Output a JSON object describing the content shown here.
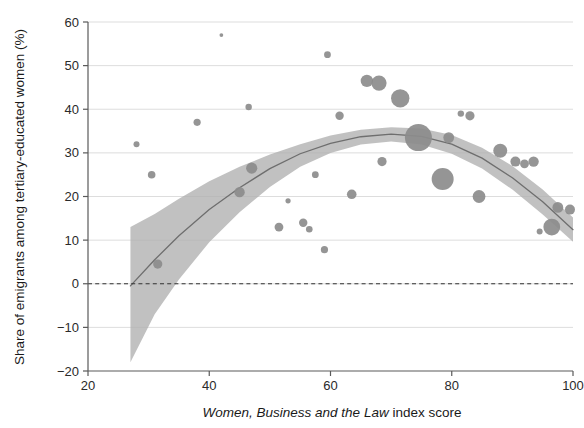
{
  "chart_data": {
    "type": "scatter",
    "title": "",
    "subtitle": "",
    "xlabel_italic": "Women, Business and the Law",
    "xlabel_rest": " index score",
    "xlabel": "Women, Business and the Law index score",
    "ylabel": "Share of emigrants among tertiary-educated women (%)",
    "xlim": [
      20,
      100
    ],
    "ylim": [
      -20,
      60
    ],
    "xticks": [
      20,
      40,
      60,
      80,
      100
    ],
    "yticks": [
      -20,
      -10,
      0,
      10,
      20,
      30,
      40,
      50,
      60
    ],
    "xtick_labels": [
      "20",
      "40",
      "60",
      "80",
      "100"
    ],
    "ytick_labels": [
      "-20",
      "-10",
      "0",
      "10",
      "20",
      "30",
      "40",
      "50",
      "60"
    ],
    "grid": "horizontal",
    "legend": "none",
    "zero_reference_line": {
      "y": 0,
      "style": "dashed"
    },
    "marker_size_encodes": "population weight (bubble area)",
    "colors": {
      "bubble": "#8c8c8c",
      "band": "#b0b0b0",
      "trend_line": "#6e6e6e",
      "grid": "#d9d9d9",
      "axis": "#5a5a5a",
      "zero_line": "#333333",
      "background": "#ffffff"
    },
    "points": [
      {
        "x": 28.0,
        "y": 32.0,
        "r": 3.0
      },
      {
        "x": 30.5,
        "y": 25.0,
        "r": 3.8
      },
      {
        "x": 31.5,
        "y": 4.5,
        "r": 4.6
      },
      {
        "x": 38.0,
        "y": 37.0,
        "r": 3.6
      },
      {
        "x": 42.0,
        "y": 57.0,
        "r": 1.9
      },
      {
        "x": 45.0,
        "y": 21.0,
        "r": 5.2
      },
      {
        "x": 46.5,
        "y": 40.5,
        "r": 3.2
      },
      {
        "x": 47.0,
        "y": 26.5,
        "r": 5.6
      },
      {
        "x": 51.5,
        "y": 13.0,
        "r": 4.4
      },
      {
        "x": 53.0,
        "y": 19.0,
        "r": 2.6
      },
      {
        "x": 55.5,
        "y": 14.0,
        "r": 4.2
      },
      {
        "x": 56.5,
        "y": 12.5,
        "r": 3.3
      },
      {
        "x": 57.5,
        "y": 25.0,
        "r": 3.4
      },
      {
        "x": 59.5,
        "y": 52.5,
        "r": 3.4
      },
      {
        "x": 59.0,
        "y": 7.8,
        "r": 3.6
      },
      {
        "x": 61.5,
        "y": 38.5,
        "r": 4.2
      },
      {
        "x": 63.5,
        "y": 20.5,
        "r": 4.8
      },
      {
        "x": 66.0,
        "y": 46.5,
        "r": 6.2
      },
      {
        "x": 68.0,
        "y": 46.0,
        "r": 7.6
      },
      {
        "x": 68.5,
        "y": 28.0,
        "r": 4.6
      },
      {
        "x": 71.5,
        "y": 42.5,
        "r": 9.2
      },
      {
        "x": 74.5,
        "y": 33.5,
        "r": 13.5
      },
      {
        "x": 78.5,
        "y": 24.0,
        "r": 11.0
      },
      {
        "x": 79.5,
        "y": 33.5,
        "r": 5.4
      },
      {
        "x": 81.5,
        "y": 39.0,
        "r": 3.2
      },
      {
        "x": 83.0,
        "y": 38.5,
        "r": 4.6
      },
      {
        "x": 84.5,
        "y": 20.0,
        "r": 6.4
      },
      {
        "x": 88.0,
        "y": 30.5,
        "r": 7.0
      },
      {
        "x": 90.5,
        "y": 28.0,
        "r": 5.0
      },
      {
        "x": 92.0,
        "y": 27.5,
        "r": 4.4
      },
      {
        "x": 93.5,
        "y": 28.0,
        "r": 5.2
      },
      {
        "x": 97.5,
        "y": 17.5,
        "r": 5.4
      },
      {
        "x": 96.5,
        "y": 13.0,
        "r": 8.4
      },
      {
        "x": 94.5,
        "y": 12.0,
        "r": 3.0
      },
      {
        "x": 99.5,
        "y": 17.0,
        "r": 5.0
      }
    ],
    "trend_line": [
      {
        "x": 27.0,
        "y": -0.5
      },
      {
        "x": 31.0,
        "y": 5.5
      },
      {
        "x": 35.0,
        "y": 11.0
      },
      {
        "x": 40.0,
        "y": 17.0
      },
      {
        "x": 45.0,
        "y": 22.0
      },
      {
        "x": 50.0,
        "y": 26.4
      },
      {
        "x": 55.0,
        "y": 29.8
      },
      {
        "x": 60.0,
        "y": 32.2
      },
      {
        "x": 65.0,
        "y": 33.7
      },
      {
        "x": 70.0,
        "y": 34.3
      },
      {
        "x": 75.0,
        "y": 33.8
      },
      {
        "x": 80.0,
        "y": 32.0
      },
      {
        "x": 85.0,
        "y": 28.8
      },
      {
        "x": 90.0,
        "y": 24.3
      },
      {
        "x": 95.0,
        "y": 18.8
      },
      {
        "x": 100.0,
        "y": 12.4
      }
    ],
    "confidence_band_upper": [
      {
        "x": 27.0,
        "y": 13.0
      },
      {
        "x": 31.0,
        "y": 16.0
      },
      {
        "x": 35.0,
        "y": 19.5
      },
      {
        "x": 40.0,
        "y": 23.5
      },
      {
        "x": 45.0,
        "y": 26.8
      },
      {
        "x": 50.0,
        "y": 29.6
      },
      {
        "x": 55.0,
        "y": 32.0
      },
      {
        "x": 60.0,
        "y": 34.0
      },
      {
        "x": 65.0,
        "y": 35.3
      },
      {
        "x": 70.0,
        "y": 35.9
      },
      {
        "x": 75.0,
        "y": 35.6
      },
      {
        "x": 80.0,
        "y": 34.1
      },
      {
        "x": 85.0,
        "y": 31.2
      },
      {
        "x": 90.0,
        "y": 27.0
      },
      {
        "x": 95.0,
        "y": 21.6
      },
      {
        "x": 100.0,
        "y": 15.2
      }
    ],
    "confidence_band_lower": [
      {
        "x": 27.0,
        "y": -18.0
      },
      {
        "x": 31.0,
        "y": -7.0
      },
      {
        "x": 35.0,
        "y": 1.0
      },
      {
        "x": 40.0,
        "y": 9.5
      },
      {
        "x": 45.0,
        "y": 16.4
      },
      {
        "x": 50.0,
        "y": 22.2
      },
      {
        "x": 55.0,
        "y": 26.8
      },
      {
        "x": 60.0,
        "y": 30.0
      },
      {
        "x": 65.0,
        "y": 31.9
      },
      {
        "x": 70.0,
        "y": 32.6
      },
      {
        "x": 75.0,
        "y": 31.9
      },
      {
        "x": 80.0,
        "y": 29.8
      },
      {
        "x": 85.0,
        "y": 26.4
      },
      {
        "x": 90.0,
        "y": 21.6
      },
      {
        "x": 95.0,
        "y": 15.9
      },
      {
        "x": 100.0,
        "y": 9.6
      }
    ]
  }
}
